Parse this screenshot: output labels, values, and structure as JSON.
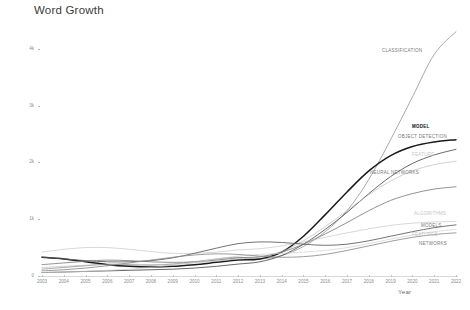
{
  "chart_data": {
    "type": "line",
    "title": "Word Growth",
    "xlabel": "Year",
    "ylabel": "Annual occurrences (loess smoothing)",
    "grid": false,
    "legend_position": "right-inline-labels",
    "xlim": [
      2003,
      2022
    ],
    "ylim": [
      0,
      4400
    ],
    "x": [
      2003,
      2004,
      2005,
      2006,
      2007,
      2008,
      2009,
      2010,
      2011,
      2012,
      2013,
      2014,
      2015,
      2016,
      2017,
      2018,
      2019,
      2020,
      2021,
      2022
    ],
    "xtick_labels": [
      "2003",
      "2004",
      "2005",
      "2006",
      "2007",
      "2008",
      "2009",
      "2010",
      "2011",
      "2012",
      "2013",
      "2014",
      "2015",
      "2016",
      "2017",
      "2018",
      "2019",
      "2020",
      "2021",
      "2022"
    ],
    "ytick_labels": [
      "0",
      "1k",
      "2k",
      "3k",
      "4k"
    ],
    "ytick_values": [
      0,
      1000,
      2000,
      3000,
      4000
    ],
    "series": [
      {
        "name": "CLASSIFICATION",
        "color": "#9a9a9a",
        "emphasis": "normal",
        "values": [
          120,
          150,
          180,
          210,
          200,
          190,
          210,
          250,
          300,
          330,
          300,
          360,
          520,
          780,
          1150,
          1700,
          2400,
          3150,
          3900,
          4300
        ]
      },
      {
        "name": "MODEL",
        "color": "#1a1a1a",
        "emphasis": "bold",
        "values": [
          330,
          300,
          250,
          200,
          170,
          160,
          170,
          200,
          240,
          280,
          300,
          420,
          700,
          1080,
          1480,
          1850,
          2120,
          2280,
          2360,
          2400
        ]
      },
      {
        "name": "OBJECT DETECTION",
        "color": "#4a4a4a",
        "emphasis": "normal",
        "values": [
          60,
          70,
          80,
          90,
          100,
          110,
          120,
          140,
          170,
          210,
          250,
          360,
          560,
          820,
          1120,
          1450,
          1750,
          1980,
          2130,
          2230
        ]
      },
      {
        "name": "FEATURE",
        "color": "#b5b5b5",
        "emphasis": "faint",
        "values": [
          150,
          170,
          190,
          200,
          210,
          200,
          210,
          230,
          260,
          300,
          330,
          430,
          620,
          870,
          1150,
          1430,
          1670,
          1850,
          1960,
          2020
        ]
      },
      {
        "name": "NEURAL NETWORKS",
        "color": "#7d7d7d",
        "emphasis": "normal",
        "values": [
          200,
          230,
          260,
          280,
          270,
          250,
          240,
          250,
          280,
          320,
          340,
          420,
          560,
          740,
          940,
          1150,
          1330,
          1450,
          1530,
          1570
        ]
      },
      {
        "name": "ALGORITHMS",
        "color": "#c0c0c0",
        "emphasis": "faint",
        "values": [
          420,
          470,
          500,
          500,
          470,
          430,
          400,
          400,
          420,
          460,
          480,
          530,
          600,
          680,
          760,
          830,
          890,
          930,
          950,
          960
        ]
      },
      {
        "name": "MODELS",
        "color": "#5a5a5a",
        "emphasis": "normal",
        "values": [
          330,
          300,
          270,
          250,
          250,
          270,
          320,
          400,
          490,
          570,
          600,
          590,
          560,
          540,
          560,
          620,
          700,
          780,
          850,
          900
        ]
      },
      {
        "name": "FEATURES",
        "color": "#cccccc",
        "emphasis": "faint",
        "values": [
          60,
          70,
          80,
          100,
          120,
          150,
          190,
          240,
          300,
          350,
          380,
          400,
          420,
          450,
          500,
          570,
          650,
          720,
          780,
          820
        ]
      },
      {
        "name": "NETWORKS",
        "color": "#8a8a8a",
        "emphasis": "normal",
        "values": [
          90,
          110,
          140,
          180,
          230,
          280,
          330,
          370,
          390,
          380,
          350,
          330,
          340,
          380,
          450,
          530,
          610,
          680,
          730,
          760
        ]
      }
    ],
    "labels_inline": [
      {
        "text": "CLASSIFICATION",
        "x": 382,
        "y": 48,
        "emphasis": "normal"
      },
      {
        "text": "MODEL",
        "x": 412,
        "y": 124,
        "emphasis": "bold"
      },
      {
        "text": "OBJECT DETECTION",
        "x": 398,
        "y": 134,
        "emphasis": "normal"
      },
      {
        "text": "FEATURE",
        "x": 412,
        "y": 152,
        "emphasis": "faint"
      },
      {
        "text": "NEURAL NETWORKS",
        "x": 370,
        "y": 170,
        "emphasis": "normal"
      },
      {
        "text": "ALGORITHMS",
        "x": 414,
        "y": 211,
        "emphasis": "faint"
      },
      {
        "text": "MODELS",
        "x": 421,
        "y": 223,
        "emphasis": "normal"
      },
      {
        "text": "FEATURES",
        "x": 412,
        "y": 232,
        "emphasis": "faint"
      },
      {
        "text": "NETWORKS",
        "x": 419,
        "y": 241,
        "emphasis": "normal"
      }
    ]
  }
}
